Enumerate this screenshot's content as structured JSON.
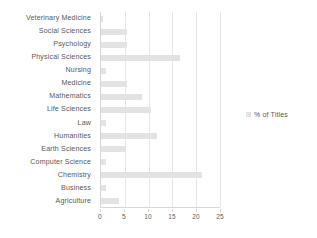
{
  "chart_data": {
    "type": "bar",
    "orientation": "horizontal",
    "title": "",
    "xlabel": "",
    "ylabel": "",
    "categories": [
      "Veterinary Medicine",
      "Social Sciences",
      "Psychology",
      "Physical Sciences",
      "Nursing",
      "Medicine",
      "Mathematics",
      "Life Sciences",
      "Law",
      "Humanities",
      "Earth Sciences",
      "Computer Science",
      "Chemistry",
      "Business",
      "Agriculture"
    ],
    "values": [
      0.5,
      5.4,
      5.4,
      16.7,
      1.0,
      5.4,
      8.6,
      10.4,
      1.0,
      11.7,
      5.0,
      1.0,
      21.2,
      1.0,
      3.8
    ],
    "series": [
      {
        "name": "% of Titles",
        "values": [
          0.5,
          5.4,
          5.4,
          16.7,
          1.0,
          5.4,
          8.6,
          10.4,
          1.0,
          11.7,
          5.0,
          1.0,
          21.2,
          1.0,
          3.8
        ]
      }
    ],
    "xlim": [
      0,
      25
    ],
    "xticks": [
      0,
      5,
      10,
      15,
      20,
      25
    ],
    "xtick_labels": [
      "0",
      "5",
      "10",
      "15",
      "20",
      "25"
    ],
    "grid": "vertical",
    "legend": {
      "position": "right",
      "entries": [
        "% of Titles"
      ]
    },
    "colors": {
      "bar": "#e3e3e3",
      "gridline": "#e6e6e6",
      "axis": "#d6d6d6",
      "text": "#585858",
      "background": "#ffffff"
    }
  }
}
